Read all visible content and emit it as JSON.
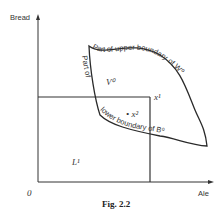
{
  "figure": {
    "caption": "Fig. 2.2",
    "y_axis_label": "Bread",
    "x_axis_label": "Ale",
    "origin_label": "0",
    "region_labels": {
      "upper_region": "V⁰",
      "lower_left_region": "L¹",
      "point_x1": "x¹",
      "point_x2": "• x²"
    },
    "curve_labels": {
      "upper": "Part of upper boundary of W⁰",
      "lower_left": "Part of",
      "lower_bottom": "lower boundary of B⁰"
    }
  }
}
